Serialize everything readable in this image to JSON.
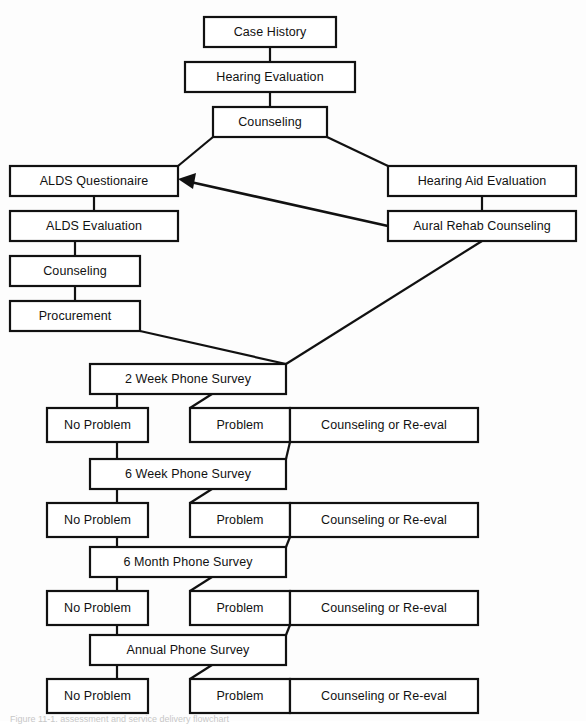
{
  "diagram": {
    "caption": "Figure 11-1.  assessment and service delivery flowchart",
    "colors": {
      "background": "#fdfdfd",
      "box_fill": "#ffffff",
      "line": "#111111",
      "text": "#111111"
    },
    "nodes": [
      {
        "id": "case-history",
        "label": "Case History",
        "x": 204,
        "y": 17,
        "w": 132,
        "h": 30
      },
      {
        "id": "hearing-evaluation",
        "label": "Hearing Evaluation",
        "x": 185,
        "y": 62,
        "w": 170,
        "h": 30
      },
      {
        "id": "counseling-top",
        "label": "Counseling",
        "x": 213,
        "y": 107,
        "w": 114,
        "h": 30
      },
      {
        "id": "alds-questionaire",
        "label": "ALDS Questionaire",
        "x": 10,
        "y": 166,
        "w": 168,
        "h": 30
      },
      {
        "id": "hearing-aid-evaluation",
        "label": "Hearing Aid Evaluation",
        "x": 388,
        "y": 166,
        "w": 188,
        "h": 30
      },
      {
        "id": "alds-evaluation",
        "label": "ALDS Evaluation",
        "x": 10,
        "y": 211,
        "w": 168,
        "h": 30
      },
      {
        "id": "aural-rehab-counseling",
        "label": "Aural Rehab Counseling",
        "x": 388,
        "y": 211,
        "w": 188,
        "h": 30
      },
      {
        "id": "counseling-alds",
        "label": "Counseling",
        "x": 10,
        "y": 256,
        "w": 130,
        "h": 30
      },
      {
        "id": "procurement",
        "label": "Procurement",
        "x": 10,
        "y": 301,
        "w": 130,
        "h": 30
      },
      {
        "id": "survey-2week",
        "label": "2 Week Phone Survey",
        "x": 90,
        "y": 364,
        "w": 196,
        "h": 30
      },
      {
        "id": "no-problem-1",
        "label": "No Problem",
        "x": 47,
        "y": 408,
        "w": 101,
        "h": 34
      },
      {
        "id": "problem-1",
        "label": "Problem",
        "x": 190,
        "y": 408,
        "w": 100,
        "h": 34
      },
      {
        "id": "counseling-reeval-1",
        "label": "Counseling or Re-eval",
        "x": 290,
        "y": 408,
        "w": 188,
        "h": 34
      },
      {
        "id": "survey-6week",
        "label": "6 Week Phone Survey",
        "x": 90,
        "y": 459,
        "w": 196,
        "h": 30
      },
      {
        "id": "no-problem-2",
        "label": "No Problem",
        "x": 47,
        "y": 503,
        "w": 101,
        "h": 34
      },
      {
        "id": "problem-2",
        "label": "Problem",
        "x": 190,
        "y": 503,
        "w": 100,
        "h": 34
      },
      {
        "id": "counseling-reeval-2",
        "label": "Counseling or Re-eval",
        "x": 290,
        "y": 503,
        "w": 188,
        "h": 34
      },
      {
        "id": "survey-6month",
        "label": "6 Month Phone Survey",
        "x": 90,
        "y": 547,
        "w": 196,
        "h": 30
      },
      {
        "id": "no-problem-3",
        "label": "No Problem",
        "x": 47,
        "y": 591,
        "w": 101,
        "h": 34
      },
      {
        "id": "problem-3",
        "label": "Problem",
        "x": 190,
        "y": 591,
        "w": 100,
        "h": 34
      },
      {
        "id": "counseling-reeval-3",
        "label": "Counseling or Re-eval",
        "x": 290,
        "y": 591,
        "w": 188,
        "h": 34
      },
      {
        "id": "survey-annual",
        "label": "Annual Phone Survey",
        "x": 90,
        "y": 635,
        "w": 196,
        "h": 30
      },
      {
        "id": "no-problem-4",
        "label": "No Problem",
        "x": 47,
        "y": 679,
        "w": 101,
        "h": 34
      },
      {
        "id": "problem-4",
        "label": "Problem",
        "x": 190,
        "y": 679,
        "w": 100,
        "h": 34
      },
      {
        "id": "counseling-reeval-4",
        "label": "Counseling or Re-eval",
        "x": 290,
        "y": 679,
        "w": 188,
        "h": 34
      }
    ],
    "connectors": [
      {
        "id": "case-history-to-hearing-evaluation",
        "points": "270,47 270,62"
      },
      {
        "id": "hearing-evaluation-to-counseling",
        "points": "270,92 270,107"
      },
      {
        "id": "counseling-to-alds-questionaire",
        "points": "213,137 178,166"
      },
      {
        "id": "counseling-to-hearing-aid-evaluation",
        "points": "327,137 388,166"
      },
      {
        "id": "alds-questionaire-to-alds-evaluation",
        "points": "94,196 94,211"
      },
      {
        "id": "alds-evaluation-to-counseling-alds",
        "points": "75,241 75,256"
      },
      {
        "id": "counseling-alds-to-procurement",
        "points": "75,286 75,301"
      },
      {
        "id": "hae-to-aural-rehab",
        "points": "482,196 482,211"
      },
      {
        "id": "procurement-to-survey-2week",
        "points": "140,331 286,364"
      },
      {
        "id": "aural-rehab-to-survey-2week",
        "points": "482,241 286,364"
      },
      {
        "id": "survey-2week-to-no-problem-1",
        "points": "117,394 117,408"
      },
      {
        "id": "survey-2week-to-problem-1",
        "points": "212,394 190,408"
      },
      {
        "id": "problem-1-to-counseling-reeval-1",
        "points": "290,425 300,425"
      },
      {
        "id": "counseling-reeval-1-to-survey-6week",
        "points": "290,442 286,459"
      },
      {
        "id": "no-problem-1-to-survey-6week",
        "points": "117,442 117,459"
      },
      {
        "id": "survey-6week-to-no-problem-2",
        "points": "117,489 117,503"
      },
      {
        "id": "survey-6week-to-problem-2",
        "points": "212,489 190,503"
      },
      {
        "id": "problem-2-to-counseling-reeval-2",
        "points": "290,520 300,520"
      },
      {
        "id": "counseling-reeval-2-to-survey-6month",
        "points": "290,537 286,547"
      },
      {
        "id": "no-problem-2-to-survey-6month",
        "points": "117,537 117,547"
      },
      {
        "id": "survey-6month-to-no-problem-3",
        "points": "117,577 117,591"
      },
      {
        "id": "survey-6month-to-problem-3",
        "points": "212,577 190,591"
      },
      {
        "id": "problem-3-to-counseling-reeval-3",
        "points": "290,608 300,608"
      },
      {
        "id": "counseling-reeval-3-to-survey-annual",
        "points": "290,625 286,635"
      },
      {
        "id": "no-problem-3-to-survey-annual",
        "points": "117,625 117,635"
      },
      {
        "id": "survey-annual-to-no-problem-4",
        "points": "117,665 117,679"
      },
      {
        "id": "survey-annual-to-problem-4",
        "points": "212,665 190,679"
      },
      {
        "id": "problem-4-to-counseling-reeval-4",
        "points": "290,696 300,696"
      }
    ],
    "arrow_connector": {
      "id": "aural-rehab-to-alds-questionaire-arrow",
      "label": "return-to-ALDS-questionaire",
      "line": "388,226 186,181",
      "head": "178,179 196,173 193,189"
    }
  }
}
